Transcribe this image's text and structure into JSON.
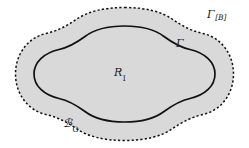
{
  "figure": {
    "type": "mathematical-region-diagram",
    "background_color": "#ffffff",
    "fill_color": "#d9d9d9",
    "stroke_color": "#111111",
    "labels": {
      "outer_boundary": {
        "base": "Γ",
        "subscript": "[B]",
        "full": "Γ[B]",
        "name": "outer-dashed-boundary-label"
      },
      "inner_boundary": {
        "base": "Γ",
        "subscript": "",
        "full": "Γ",
        "name": "inner-solid-boundary-label"
      },
      "interior_region": {
        "base": "R",
        "subscript": "I",
        "full": "R_I",
        "name": "interior-region-label"
      },
      "outer_region": {
        "base": "ℬ",
        "subscript": "O",
        "full": "B_O",
        "name": "outer-region-label"
      }
    },
    "curves": {
      "inner": {
        "style": "solid",
        "width": 1.6,
        "name": "inner-solid-curve"
      },
      "outer": {
        "style": "dashed",
        "width": 1.5,
        "dash_pattern": "2.2 2.2",
        "name": "outer-dashed-curve"
      }
    }
  }
}
